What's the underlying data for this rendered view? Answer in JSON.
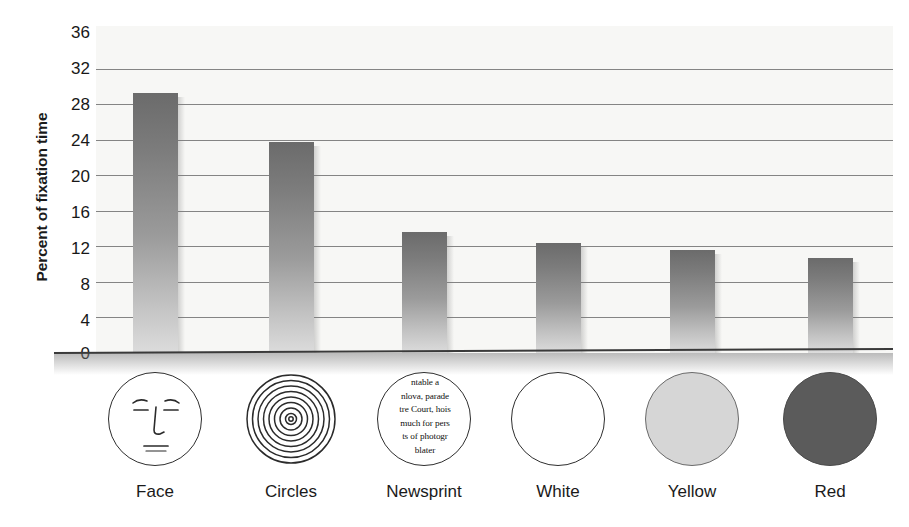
{
  "chart_data": {
    "type": "bar",
    "title": "",
    "xlabel": "",
    "ylabel": "Percent of fixation time",
    "categories": [
      "Face",
      "Circles",
      "Newsprint",
      "White",
      "Yellow",
      "Red"
    ],
    "values": [
      29.3,
      23.8,
      13.6,
      12.4,
      11.6,
      10.7
    ],
    "ylim": [
      0,
      36
    ],
    "yticks": [
      0,
      4,
      8,
      12,
      16,
      20,
      24,
      28,
      32,
      36
    ],
    "ytick_labels": [
      "0",
      "4",
      "8",
      "12",
      "16",
      "20",
      "24",
      "28",
      "32",
      "36"
    ],
    "grid": true,
    "gridlines_at": [
      4,
      8,
      12,
      16,
      20,
      24,
      28,
      32
    ],
    "legend": "none",
    "series": [
      {
        "name": "Percent of fixation time",
        "values": [
          29.3,
          23.8,
          13.6,
          12.4,
          11.6,
          10.7
        ]
      }
    ],
    "bar_fill": "vertical-gradient-dark-top-to-light-bottom",
    "colors": {
      "bar_top": "#6b6b6b",
      "bar_bottom": "#dcdcdc",
      "plot_background": "#f7f7f5",
      "gridline": "#5d5d5d",
      "axis": "#3a3a3a",
      "text": "#1a1a1a",
      "yellow_swatch": "#d6d6d6",
      "red_swatch": "#5b5b5b",
      "white_swatch": "#ffffff"
    }
  },
  "axis": {
    "y_title": "Percent of fixation time",
    "ticks": [
      "36",
      "32",
      "28",
      "24",
      "20",
      "16",
      "12",
      "8",
      "4",
      "0"
    ]
  },
  "categories": [
    {
      "label": "Face",
      "icon": "face-icon",
      "value": 29.3
    },
    {
      "label": "Circles",
      "icon": "concentric-circles-icon",
      "value": 23.8
    },
    {
      "label": "Newsprint",
      "icon": "newsprint-icon",
      "value": 13.6
    },
    {
      "label": "White",
      "icon": "white-circle-icon",
      "value": 12.4
    },
    {
      "label": "Yellow",
      "icon": "yellow-circle-icon",
      "value": 11.6
    },
    {
      "label": "Red",
      "icon": "red-circle-icon",
      "value": 10.7
    }
  ],
  "newsprint_lines": [
    "ntable a",
    "nlova, parade",
    "tre Court, hois",
    "much for pers",
    "ts of photogr",
    "blater"
  ]
}
